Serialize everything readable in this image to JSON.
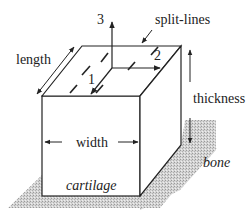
{
  "diagram": {
    "type": "3d-block-schematic",
    "labels": {
      "length": "length",
      "width": "width",
      "thickness": "thickness",
      "split_lines": "split-lines",
      "material_block": "cartilage",
      "substrate": "bone",
      "axis_1": "1",
      "axis_2": "2",
      "axis_3": "3"
    },
    "colors": {
      "line": "#222222",
      "shadow": "#c8c8c8",
      "background": "#ffffff"
    }
  }
}
